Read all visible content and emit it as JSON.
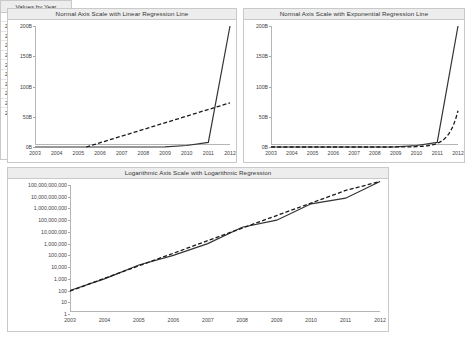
{
  "charts": {
    "linear": {
      "title": "Normal Axis Scale with Linear Regression Line",
      "yticks": [
        "200B",
        "150B",
        "100B",
        "50B",
        "0B"
      ],
      "xticks": [
        "2003",
        "2004",
        "2005",
        "2006",
        "2007",
        "2008",
        "2009",
        "2010",
        "2011",
        "2012"
      ]
    },
    "exponential": {
      "title": "Normal Axis Scale with Exponential Regression Line",
      "yticks": [
        "200B",
        "150B",
        "100B",
        "50B",
        "0B"
      ],
      "xticks": [
        "2003",
        "2004",
        "2005",
        "2006",
        "2007",
        "2008",
        "2009",
        "2010",
        "2011",
        "2012"
      ]
    },
    "logarithmic": {
      "title": "Logarithmic Axis Scale with Logarithmic Regression",
      "yticks": [
        "100,000,000,000",
        "10,000,000,000",
        "1,000,000,000",
        "100,000,000",
        "10,000,000",
        "1,000,000",
        "100,000",
        "10,000",
        "1,000",
        "100",
        "10",
        "1"
      ],
      "xticks": [
        "2003",
        "2004",
        "2005",
        "2006",
        "2007",
        "2008",
        "2009",
        "2010",
        "2011",
        "2012"
      ]
    }
  },
  "table": {
    "title": "Values by Year",
    "value_header": "value",
    "rows": [
      {
        "year": "2003",
        "value": "100"
      },
      {
        "year": "2004",
        "value": "1,000"
      },
      {
        "year": "2005",
        "value": "15,000"
      },
      {
        "year": "2006",
        "value": "100,000"
      },
      {
        "year": "2007",
        "value": "1,000,000"
      },
      {
        "year": "2008",
        "value": "25,000,000"
      },
      {
        "year": "2009",
        "value": "100,000,000"
      },
      {
        "year": "2010",
        "value": "2,500,000,000"
      },
      {
        "year": "2011",
        "value": "7,500,000,000"
      },
      {
        "year": "2012",
        "value": "200,000,000,000"
      }
    ]
  },
  "colors": {
    "series_line": "#333333",
    "regression_line": "#1a1a1a",
    "panel_header": "#ededed",
    "border": "#c9c9c9"
  },
  "chart_data": [
    {
      "type": "line",
      "title": "Normal Axis Scale with Linear Regression Line",
      "xlabel": "",
      "ylabel": "",
      "x": [
        2003,
        2004,
        2005,
        2006,
        2007,
        2008,
        2009,
        2010,
        2011,
        2012
      ],
      "ylim": [
        0,
        200000000000
      ],
      "ytick_values": [
        0,
        50000000000,
        100000000000,
        150000000000,
        200000000000
      ],
      "ytick_labels": [
        "0B",
        "50B",
        "100B",
        "150B",
        "200B"
      ],
      "grid": false,
      "legend": "none",
      "series": [
        {
          "name": "value",
          "style": "solid",
          "values": [
            100,
            1000,
            15000,
            100000,
            1000000,
            25000000,
            100000000,
            2500000000,
            7500000000,
            200000000000
          ]
        },
        {
          "name": "linear regression",
          "style": "dashed",
          "values": [
            -26000000000,
            -15000000000,
            -4000000000,
            7000000000,
            18000000000,
            29000000000,
            40000000000,
            51000000000,
            62000000000,
            73000000000
          ]
        }
      ]
    },
    {
      "type": "line",
      "title": "Normal Axis Scale with Exponential Regression Line",
      "xlabel": "",
      "ylabel": "",
      "x": [
        2003,
        2004,
        2005,
        2006,
        2007,
        2008,
        2009,
        2010,
        2011,
        2012
      ],
      "ylim": [
        0,
        200000000000
      ],
      "ytick_values": [
        0,
        50000000000,
        100000000000,
        150000000000,
        200000000000
      ],
      "ytick_labels": [
        "0B",
        "50B",
        "100B",
        "150B",
        "200B"
      ],
      "grid": false,
      "legend": "none",
      "series": [
        {
          "name": "value",
          "style": "solid",
          "values": [
            100,
            1000,
            15000,
            100000,
            1000000,
            25000000,
            100000000,
            2500000000,
            7500000000,
            200000000000
          ]
        },
        {
          "name": "exponential regression",
          "style": "dashed",
          "values": [
            60,
            600,
            6000,
            60000,
            600000,
            6000000,
            60000000,
            600000000,
            6000000000,
            60000000000
          ]
        }
      ]
    },
    {
      "type": "line",
      "title": "Logarithmic Axis Scale with Logarithmic Regression",
      "xlabel": "",
      "ylabel": "",
      "x": [
        2003,
        2004,
        2005,
        2006,
        2007,
        2008,
        2009,
        2010,
        2011,
        2012
      ],
      "yscale": "log",
      "ylim": [
        1,
        100000000000
      ],
      "ytick_values": [
        1,
        10,
        100,
        1000,
        10000,
        100000,
        1000000,
        10000000,
        100000000,
        1000000000,
        10000000000,
        100000000000
      ],
      "ytick_labels": [
        "1",
        "10",
        "100",
        "1,000",
        "10,000",
        "100,000",
        "1,000,000",
        "10,000,000",
        "100,000,000",
        "1,000,000,000",
        "10,000,000,000",
        "100,000,000,000"
      ],
      "grid": false,
      "legend": "none",
      "series": [
        {
          "name": "value",
          "style": "solid",
          "values": [
            100,
            1000,
            15000,
            100000,
            1000000,
            25000000,
            100000000,
            2500000000,
            7500000000,
            200000000000
          ]
        },
        {
          "name": "logarithmic regression",
          "style": "dashed",
          "values": [
            90,
            1100,
            13000,
            150000,
            1800000,
            21000000,
            250000000,
            2900000000,
            34000000000,
            200000000000
          ]
        }
      ]
    }
  ]
}
